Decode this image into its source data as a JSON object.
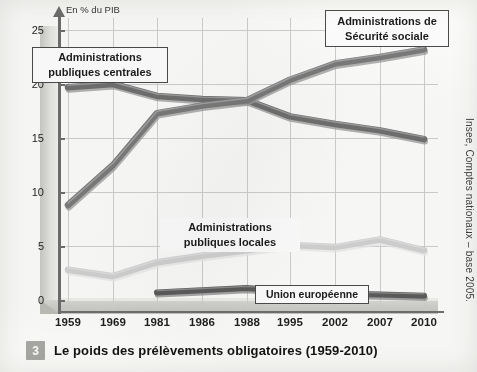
{
  "caption": {
    "number": "3",
    "text": "Le poids des prélèvements obligatoires (1959-2010)"
  },
  "source": "Insee, Comptes nationaux – base 2005.",
  "callouts": {
    "centrales": "Administrations\npubliques centrales",
    "centrales_line1": "Administrations",
    "centrales_line2": "publiques centrales",
    "secu_line1": "Administrations de",
    "secu_line2": "Sécurité sociale",
    "locales_line1": "Administrations",
    "locales_line2": "publiques locales",
    "ue": "Union européenne"
  },
  "chart_data": {
    "type": "line",
    "title": "Le poids des prélèvements obligatoires (1959-2010)",
    "xlabel": "",
    "ylabel": "En % du PIB",
    "ylim": [
      0,
      25
    ],
    "yticks": [
      0,
      5,
      10,
      15,
      20,
      25
    ],
    "grid": true,
    "legend_position": "inline-callouts",
    "categories": [
      "1959",
      "1969",
      "1981",
      "1986",
      "1988",
      "1995",
      "2002",
      "2007",
      "2010"
    ],
    "series": [
      {
        "name": "Administrations publiques centrales",
        "color": "#6f6f6f",
        "values": [
          19.7,
          20.0,
          18.9,
          18.6,
          18.5,
          17.0,
          16.3,
          15.7,
          14.9
        ]
      },
      {
        "name": "Administrations de Sécurité sociale",
        "color": "#7a7a7a",
        "values": [
          8.8,
          12.5,
          17.3,
          18.0,
          18.5,
          20.4,
          21.9,
          22.5,
          23.2
        ]
      },
      {
        "name": "Administrations publiques locales",
        "color": "#d2d2d2",
        "values": [
          2.8,
          2.2,
          3.5,
          4.1,
          4.6,
          5.1,
          4.9,
          5.6,
          4.6
        ]
      },
      {
        "name": "Union européenne",
        "color": "#5a5a5a",
        "values": [
          null,
          null,
          0.7,
          0.9,
          1.1,
          0.8,
          0.6,
          0.5,
          0.4
        ]
      }
    ]
  },
  "axis": {
    "y_unit_label": "En % du PIB"
  }
}
